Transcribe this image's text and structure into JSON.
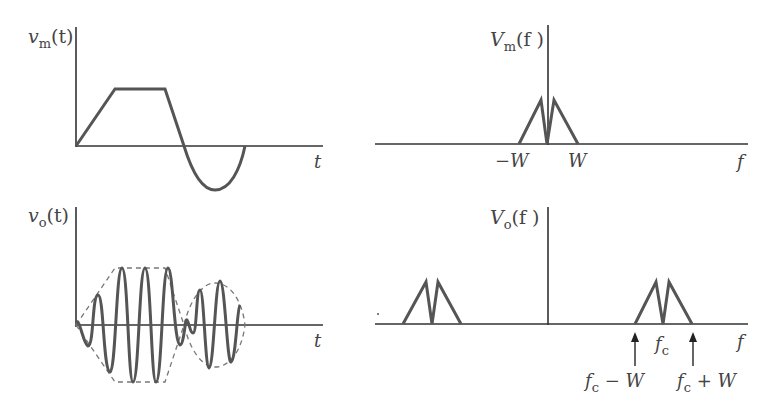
{
  "panels": {
    "vm_time": {
      "ylabel_var": "v",
      "ylabel_sub": "m",
      "ylabel_arg": "(t)",
      "xlabel": "t"
    },
    "vm_freq": {
      "ylabel_var": "V",
      "ylabel_sub": "m",
      "ylabel_arg": "(f )",
      "xlabel": "f",
      "tick_neg": "−W",
      "tick_pos": "W"
    },
    "vo_time": {
      "ylabel_var": "v",
      "ylabel_sub": "o",
      "ylabel_arg": "(t)",
      "xlabel": "t"
    },
    "vo_freq": {
      "ylabel_var": "V",
      "ylabel_sub": "o",
      "ylabel_arg": "(f )",
      "xlabel": "f",
      "center_label_var": "f",
      "center_label_sub": "c",
      "lower_label_var": "f",
      "lower_label_sub": "c",
      "lower_label_rest": " − W",
      "upper_label_var": "f",
      "upper_label_sub": "c",
      "upper_label_rest": " + W"
    }
  },
  "colors": {
    "axis": "#333333",
    "signal": "#555555",
    "envelope": "#777777",
    "text": "#444444"
  }
}
